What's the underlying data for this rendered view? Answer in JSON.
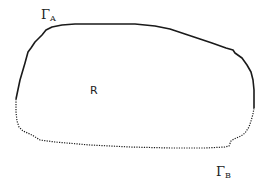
{
  "diagram": {
    "labels": {
      "gamma_a": {
        "symbol": "Γ",
        "subscript": "A"
      },
      "gamma_b": {
        "symbol": "Γ",
        "subscript": "B"
      },
      "region": "R"
    },
    "boundaries": [
      {
        "name": "Γ_A",
        "style": "solid"
      },
      {
        "name": "Γ_B",
        "style": "dotted"
      }
    ],
    "stroke_color": "#1a1a1a"
  }
}
